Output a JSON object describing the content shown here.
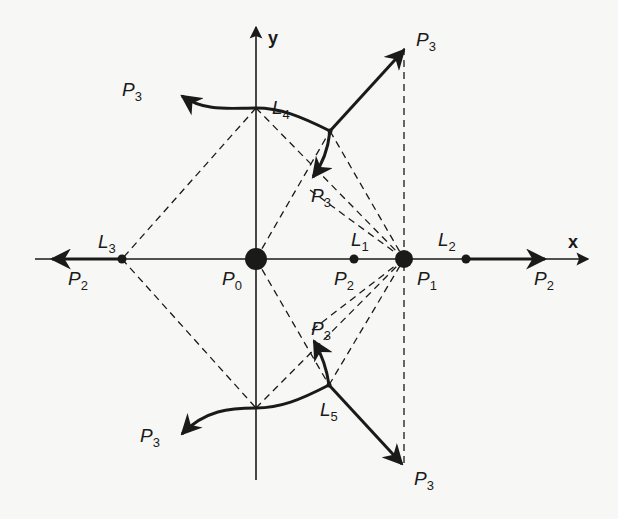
{
  "diagram": {
    "axes": {
      "x_label": "x",
      "y_label": "y"
    },
    "points": {
      "P0": {
        "label": "P",
        "sub": "0"
      },
      "P1": {
        "label": "P",
        "sub": "1"
      }
    },
    "labels": [
      {
        "id": "P3-top-right",
        "main": "P",
        "sub": "3"
      },
      {
        "id": "P3-top-left",
        "main": "P",
        "sub": "3"
      },
      {
        "id": "L4",
        "main": "L",
        "sub": "4"
      },
      {
        "id": "P3-upper-mid",
        "main": "P",
        "sub": "3"
      },
      {
        "id": "L3",
        "main": "L",
        "sub": "3"
      },
      {
        "id": "L1",
        "main": "L",
        "sub": "1"
      },
      {
        "id": "L2",
        "main": "L",
        "sub": "2"
      },
      {
        "id": "P2-left",
        "main": "P",
        "sub": "2"
      },
      {
        "id": "P0",
        "main": "P",
        "sub": "0"
      },
      {
        "id": "P2-mid",
        "main": "P",
        "sub": "2"
      },
      {
        "id": "P1",
        "main": "P",
        "sub": "1"
      },
      {
        "id": "P2-right",
        "main": "P",
        "sub": "2"
      },
      {
        "id": "P3-lower-mid",
        "main": "P",
        "sub": "3"
      },
      {
        "id": "L5",
        "main": "L",
        "sub": "5"
      },
      {
        "id": "P3-bottom-left",
        "main": "P",
        "sub": "3"
      },
      {
        "id": "P3-bottom-right",
        "main": "P",
        "sub": "3"
      }
    ],
    "colors": {
      "ink": "#1a1a1a",
      "paper": "#f7f7f5"
    }
  }
}
